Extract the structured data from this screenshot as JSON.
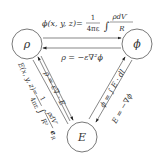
{
  "diagram": {
    "type": "triangle relation diagram",
    "nodes": [
      {
        "id": "rho",
        "label": "ρ"
      },
      {
        "id": "phi",
        "label": "ϕ"
      },
      {
        "id": "E",
        "label": "E"
      }
    ],
    "edges": {
      "rho_to_phi": {
        "label_lhs": "ϕ(x, y, z)=",
        "frac_num": "1",
        "frac_den": "4πε",
        "integral": "∫",
        "int_num": "ρdV′",
        "int_den": "R"
      },
      "phi_to_rho": {
        "label": "ρ = −ε∇²ϕ"
      },
      "rho_to_E": {
        "label_lhs": "E(x, y, z)=",
        "frac_num": "1",
        "frac_den": "4πε",
        "integral": "∫",
        "int_num": "ρdV′",
        "int_den": "R²",
        "unit_vec": "e",
        "unit_sub": "R"
      },
      "E_to_rho": {
        "label": "ρ = ε∇ · E"
      },
      "E_to_phi": {
        "label": "ϕ = ∫ E · dl",
        "lim_low": "P",
        "lim_high": "∞"
      },
      "phi_to_E": {
        "label": "E = −∇ϕ"
      }
    }
  }
}
